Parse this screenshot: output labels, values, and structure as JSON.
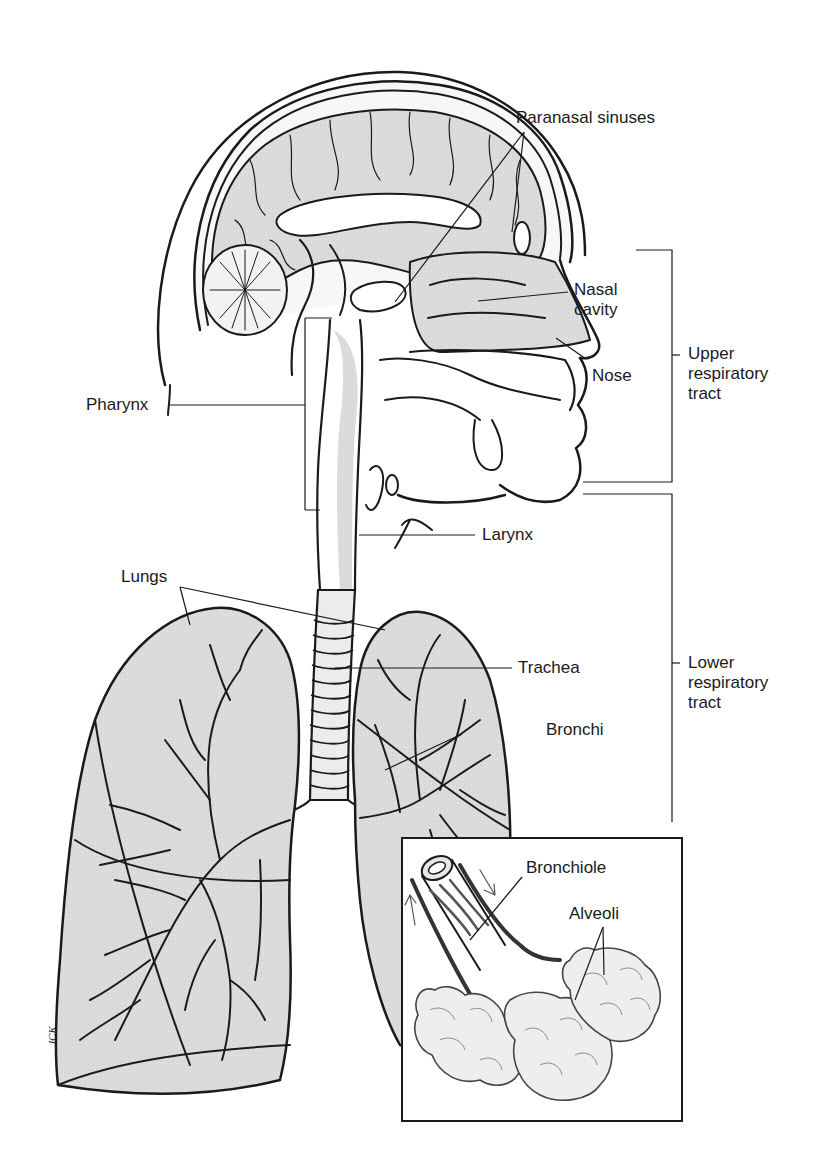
{
  "figure": {
    "artist_initials": "JCK",
    "colors": {
      "outline": "#1a1a1a",
      "tissue_fill": "#d9d9d9",
      "light_fill": "#ececec",
      "background": "#ffffff"
    }
  },
  "labels": {
    "paranasal_sinuses": "Paranasal sinuses",
    "nasal_cavity_line1": "Nasal",
    "nasal_cavity_line2": "cavity",
    "nose": "Nose",
    "pharynx": "Pharynx",
    "larynx": "Larynx",
    "lungs": "Lungs",
    "trachea": "Trachea",
    "bronchi": "Bronchi",
    "bronchiole": "Bronchiole",
    "alveoli": "Alveoli"
  },
  "brackets": {
    "upper": {
      "line1": "Upper",
      "line2": "respiratory",
      "line3": "tract"
    },
    "lower": {
      "line1": "Lower",
      "line2": "respiratory",
      "line3": "tract"
    }
  },
  "inset": {
    "label": "Bronchiole and alveoli detail"
  }
}
